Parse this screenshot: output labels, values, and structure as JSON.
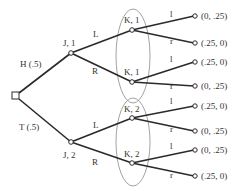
{
  "diagram": {
    "type": "extensive-form game tree",
    "root": {
      "shape": "square"
    },
    "chance_moves": [
      {
        "label": "H (.5)"
      },
      {
        "label": "T (.5)"
      }
    ],
    "player_j_nodes": [
      {
        "label": "J, 1"
      },
      {
        "label": "J, 2"
      }
    ],
    "j_actions": {
      "left": "L",
      "right": "R"
    },
    "player_k_nodes": [
      {
        "label": "K, 1"
      },
      {
        "label": "K, 1"
      },
      {
        "label": "K, 2"
      },
      {
        "label": "K, 2"
      }
    ],
    "k_actions": {
      "left": "l",
      "right": "r"
    },
    "payoffs": [
      "(0, .25)",
      "(.25, 0)",
      "(.25, 0)",
      "(0, .25)",
      "(.25, 0)",
      "(0, .25)",
      "(0, .25)",
      "(.25, 0)"
    ]
  }
}
